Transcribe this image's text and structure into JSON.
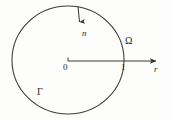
{
  "figure": {
    "type": "math-diagram",
    "background_color": "#fdfdfc",
    "stroke_color": "#3a3a3a",
    "text_color": "#2b2b2b",
    "labels": {
      "normal": "n",
      "domain": "Ω",
      "origin": "0",
      "unit": "1",
      "radial_axis": "r",
      "boundary": "Γ"
    },
    "geometry": {
      "circle_center_x": 68,
      "circle_center_y": 60,
      "circle_radius_x": 56,
      "circle_radius_y": 54,
      "axis_start_x": 68,
      "axis_end_x": 161,
      "axis_y": 61,
      "normal_arrow_start_x": 78,
      "normal_arrow_start_y": 6,
      "normal_arrow_end_x": 79,
      "normal_arrow_end_y": 28
    }
  }
}
